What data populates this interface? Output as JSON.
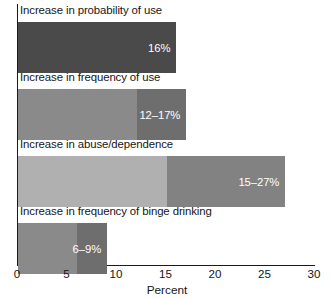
{
  "chart_data": {
    "type": "bar",
    "orientation": "horizontal",
    "title": "",
    "subtitle": "",
    "xlabel": "Percent",
    "ylabel": "",
    "xlim": [
      0,
      30
    ],
    "xticks": [
      0,
      5,
      10,
      15,
      20,
      25,
      30
    ],
    "xtick_labels": [
      "0",
      "5",
      "10",
      "15",
      "20",
      "25",
      "30"
    ],
    "grid": false,
    "legend": "none",
    "categories": [
      "Increase in probability of use",
      "Increase in frequency of use",
      "Increase in abuse/dependence",
      "Increase in frequency of binge drinking"
    ],
    "values": [
      16,
      17,
      27,
      9
    ],
    "ranges": [
      {
        "low": 16,
        "high": 16
      },
      {
        "low": 12,
        "high": 17
      },
      {
        "low": 15,
        "high": 27
      },
      {
        "low": 6,
        "high": 9
      }
    ],
    "value_labels": [
      "16%",
      "12–17%",
      "15–27%",
      "6–9%"
    ],
    "bars": [
      {
        "label": "Increase in probability of use",
        "value_label": "16%",
        "low": 0,
        "high": 16,
        "base_color": "#4a4a4a",
        "top_color": "#4a4a4a"
      },
      {
        "label": "Increase in frequency of use",
        "value_label": "12–17%",
        "low": 12,
        "high": 17,
        "base_color": "#8a8a8a",
        "top_color": "#6e6e6e"
      },
      {
        "label": "Increase in abuse/dependence",
        "value_label": "15–27%",
        "low": 15,
        "high": 27,
        "base_color": "#b0b0b0",
        "top_color": "#828282"
      },
      {
        "label": "Increase in frequency of binge drinking",
        "value_label": "6–9%",
        "low": 6,
        "high": 9,
        "base_color": "#8a8a8a",
        "top_color": "#6e6e6e"
      }
    ],
    "colors": {
      "axis": "#1b1b1b",
      "text": "#161616",
      "value_text": "#ffffff",
      "background": "#ffffff"
    }
  }
}
